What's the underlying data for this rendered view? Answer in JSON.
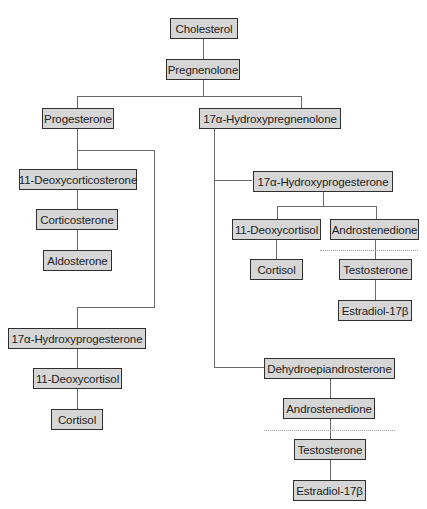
{
  "diagram": {
    "title": "",
    "type": "steroid-biosynthesis-pathway",
    "colors": {
      "node_fill": "#d6d6d6",
      "node_border": "#2f2f2f",
      "text": "#222222",
      "connector": "#6a6a6a",
      "dotted_divider": "#9a9a9a"
    },
    "nodes": {
      "cholesterol": "Cholesterol",
      "pregnenolone": "Pregnenolone",
      "progesterone": "Progesterone",
      "hydroxypregnenolone": "17α-Hydroxypregnenolone",
      "deoxycorticosterone": "11-Deoxycorticosterone",
      "corticosterone": "Corticosterone",
      "aldosterone": "Aldosterone",
      "hydroxyprogesterone_left": "17α-Hydroxyprogesterone",
      "deoxycortisol_left": "11-Deoxycortisol",
      "cortisol_left": "Cortisol",
      "hydroxyprogesterone_right": "17α-Hydroxyprogesterone",
      "deoxycortisol_right": "11-Deoxycortisol",
      "cortisol_right": "Cortisol",
      "androstenedione_right": "Androstenedione",
      "testosterone_right": "Testosterone",
      "estradiol_right": "Estradiol-17β",
      "dhea": "Dehydroepiandrosterone",
      "androstenedione_lower": "Androstenedione",
      "testosterone_lower": "Testosterone",
      "estradiol_lower": "Estradiol-17β"
    },
    "edges": [
      [
        "cholesterol",
        "pregnenolone"
      ],
      [
        "pregnenolone",
        "progesterone"
      ],
      [
        "pregnenolone",
        "hydroxypregnenolone"
      ],
      [
        "progesterone",
        "deoxycorticosterone"
      ],
      [
        "deoxycorticosterone",
        "corticosterone"
      ],
      [
        "corticosterone",
        "aldosterone"
      ],
      [
        "progesterone",
        "hydroxyprogesterone_left"
      ],
      [
        "hydroxyprogesterone_left",
        "deoxycortisol_left"
      ],
      [
        "deoxycortisol_left",
        "cortisol_left"
      ],
      [
        "hydroxypregnenolone",
        "hydroxyprogesterone_right"
      ],
      [
        "hydroxyprogesterone_right",
        "deoxycortisol_right"
      ],
      [
        "deoxycortisol_right",
        "cortisol_right"
      ],
      [
        "hydroxyprogesterone_right",
        "androstenedione_right"
      ],
      [
        "androstenedione_right",
        "testosterone_right"
      ],
      [
        "testosterone_right",
        "estradiol_right"
      ],
      [
        "hydroxypregnenolone",
        "dhea"
      ],
      [
        "dhea",
        "androstenedione_lower"
      ],
      [
        "androstenedione_lower",
        "testosterone_lower"
      ],
      [
        "testosterone_lower",
        "estradiol_lower"
      ]
    ]
  }
}
